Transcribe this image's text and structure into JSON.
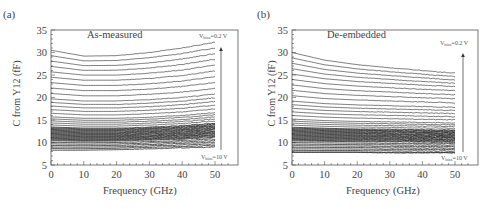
{
  "figure": {
    "panels": [
      {
        "tag": "(a)",
        "title": "As-measured",
        "xlabel": "Frequency (GHz)",
        "ylabel": "C from Y12 (fF)",
        "top_annotation": {
          "prefix": "V",
          "sub": "bias",
          "suffix": "=0.2 V"
        },
        "bottom_annotation": {
          "prefix": "V",
          "sub": "bias",
          "suffix": "=10 V"
        }
      },
      {
        "tag": "(b)",
        "title": "De-embedded",
        "xlabel": "Frequency (GHz)",
        "ylabel": "C from Y12 (fF)",
        "top_annotation": {
          "prefix": "V",
          "sub": "bias",
          "suffix": "=0.2 V"
        },
        "bottom_annotation": {
          "prefix": "V",
          "sub": "bias",
          "suffix": "=10 V"
        }
      }
    ]
  },
  "chart_data": [
    {
      "type": "line",
      "title": "As-measured",
      "panel_label": "(a)",
      "xlabel": "Frequency (GHz)",
      "ylabel": "C from Y12 (fF)",
      "xlim": [
        0,
        55
      ],
      "ylim": [
        5,
        35
      ],
      "xticks": [
        0,
        10,
        20,
        30,
        40,
        50
      ],
      "yticks": [
        5,
        10,
        15,
        20,
        25,
        30,
        35
      ],
      "grid": false,
      "x_range_data": [
        0,
        50
      ],
      "series_description": "Family of C-f curves swept over bias voltage from 0.2 V (top) to 10 V (bottom); curves dip slightly near 10-20 GHz then rise toward 50 GHz",
      "series": [
        {
          "name": "Vbias=0.2 V",
          "x": [
            0,
            10,
            20,
            30,
            40,
            50
          ],
          "values": [
            30.5,
            29.2,
            29.3,
            30.0,
            31.0,
            32.3
          ]
        },
        {
          "name": "mid-bias (~25 fF)",
          "x": [
            0,
            10,
            20,
            30,
            40,
            50
          ],
          "values": [
            25.5,
            24.8,
            24.8,
            25.2,
            25.9,
            27.0
          ]
        },
        {
          "name": "mid-bias (~20 fF)",
          "x": [
            0,
            10,
            20,
            30,
            40,
            50
          ],
          "values": [
            20.5,
            20.0,
            20.0,
            20.3,
            20.8,
            21.6
          ]
        },
        {
          "name": "dense band (~12 fF)",
          "x": [
            0,
            10,
            20,
            30,
            40,
            50
          ],
          "values": [
            12.0,
            11.8,
            11.8,
            12.0,
            12.3,
            12.8
          ]
        },
        {
          "name": "Vbias=10 V",
          "x": [
            0,
            10,
            20,
            30,
            40,
            50
          ],
          "values": [
            8.3,
            8.3,
            8.4,
            8.6,
            8.8,
            9.0
          ]
        }
      ],
      "annotations": [
        "Vbias=0.2 V (top, with upward arrow)",
        "Vbias=10 V (bottom)"
      ]
    },
    {
      "type": "line",
      "title": "De-embedded",
      "panel_label": "(b)",
      "xlabel": "Frequency (GHz)",
      "ylabel": "C from Y12 (fF)",
      "xlim": [
        0,
        55
      ],
      "ylim": [
        5,
        35
      ],
      "xticks": [
        0,
        10,
        20,
        30,
        40,
        50
      ],
      "yticks": [
        5,
        10,
        15,
        20,
        25,
        30,
        35
      ],
      "grid": false,
      "x_range_data": [
        0,
        50
      ],
      "series_description": "Family of C-f curves swept over bias voltage from 0.2 V (top) to 10 V (bottom); curves decrease slightly with frequency (flatter than as-measured)",
      "series": [
        {
          "name": "Vbias=0.2 V",
          "x": [
            0,
            10,
            20,
            30,
            40,
            50
          ],
          "values": [
            30.0,
            28.3,
            27.3,
            26.6,
            26.0,
            25.4
          ]
        },
        {
          "name": "mid-bias (~25 fF)",
          "x": [
            0,
            10,
            20,
            30,
            40,
            50
          ],
          "values": [
            25.0,
            24.0,
            23.4,
            23.0,
            22.6,
            22.3
          ]
        },
        {
          "name": "mid-bias (~20 fF)",
          "x": [
            0,
            10,
            20,
            30,
            40,
            50
          ],
          "values": [
            20.0,
            19.4,
            19.1,
            18.9,
            18.7,
            18.5
          ]
        },
        {
          "name": "dense band (~11 fF)",
          "x": [
            0,
            10,
            20,
            30,
            40,
            50
          ],
          "values": [
            11.0,
            10.9,
            10.8,
            10.8,
            10.7,
            10.7
          ]
        },
        {
          "name": "Vbias=10 V",
          "x": [
            0,
            10,
            20,
            30,
            40,
            50
          ],
          "values": [
            7.8,
            7.8,
            7.8,
            7.7,
            7.7,
            7.7
          ]
        }
      ],
      "annotations": [
        "Vbias=0.2 V (top, with upward arrow)",
        "Vbias=10 V (bottom)"
      ]
    }
  ],
  "colors": {
    "axis": "#555555",
    "curve": "#222222",
    "text": "#444444"
  }
}
